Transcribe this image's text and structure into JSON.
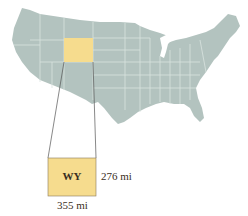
{
  "figure": {
    "highlighted_state": {
      "abbr": "WY",
      "name": "Wyoming",
      "height_label": "276 mi",
      "width_label": "355 mi"
    },
    "colors": {
      "map_fill": "#b3c3bf",
      "state_borders": "#d9e3e0",
      "highlight_fill": "#f6dc8e",
      "highlight_stroke": "#8a7a5a",
      "connector_lines": "#555555",
      "text": "#3a2e22"
    }
  }
}
